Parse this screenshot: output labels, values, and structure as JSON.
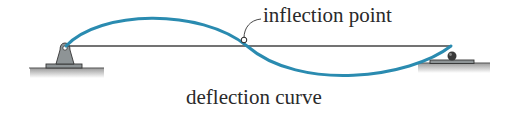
{
  "diagram": {
    "type": "beam-deflection",
    "annotation_label": "inflection point",
    "caption": "deflection curve",
    "colors": {
      "curve": "#2a8bb0",
      "beam": "#444444",
      "support_fill": "#8e9496",
      "support_stroke": "#333333",
      "ground": "#555555"
    },
    "supports": [
      {
        "kind": "pin",
        "position": "left"
      },
      {
        "kind": "roller",
        "position": "right"
      }
    ]
  }
}
